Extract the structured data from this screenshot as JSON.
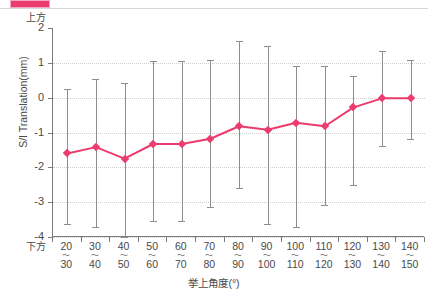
{
  "legend": {
    "swatch_color": "#ec3b6e",
    "text": "",
    "note": "cut-off legend row at top of image"
  },
  "axes": {
    "y_title": "S/I Translation(mm)",
    "y_direction_top": "上方",
    "y_direction_bottom": "下方",
    "x_title": "挙上角度(°)"
  },
  "chart_data": {
    "type": "line",
    "title": "",
    "xlabel": "挙上角度(°)",
    "ylabel": "S/I Translation(mm)",
    "ylim": [
      -4,
      2
    ],
    "yticks": [
      2,
      1,
      0,
      -1,
      -2,
      -3,
      -4
    ],
    "ytick_labels": [
      "2",
      "1",
      "0",
      "-1",
      "-2",
      "-3",
      "-4"
    ],
    "grid": true,
    "legend_position": "top",
    "categories": [
      "20~30",
      "30~40",
      "40~50",
      "50~60",
      "60~70",
      "70~80",
      "80~90",
      "90~100",
      "100~110",
      "110~120",
      "120~130",
      "130~140",
      "140~150"
    ],
    "category_low": [
      20,
      30,
      40,
      50,
      60,
      70,
      80,
      90,
      100,
      110,
      120,
      130,
      140
    ],
    "category_high": [
      30,
      40,
      50,
      60,
      70,
      80,
      90,
      100,
      110,
      120,
      130,
      140,
      150
    ],
    "series": [
      {
        "name": "S/I Translation",
        "color": "#ec3b6e",
        "marker": "diamond",
        "values": [
          -1.6,
          -1.42,
          -1.75,
          -1.33,
          -1.33,
          -1.18,
          -0.82,
          -0.92,
          -0.72,
          -0.82,
          -0.28,
          -0.02,
          -0.02
        ],
        "error_low": [
          -3.62,
          -3.72,
          -4.0,
          -3.55,
          -3.55,
          -3.15,
          -2.6,
          -3.62,
          -3.72,
          -3.08,
          -2.52,
          -1.38,
          -1.2
        ],
        "error_high": [
          0.25,
          0.55,
          0.42,
          1.05,
          1.05,
          1.08,
          1.62,
          1.48,
          0.92,
          0.9,
          0.62,
          1.35,
          1.08
        ],
        "error_type": "SD"
      }
    ]
  }
}
